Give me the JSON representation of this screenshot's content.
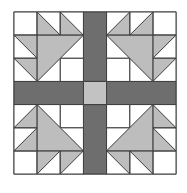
{
  "diagram": {
    "type": "quilt-block",
    "title": "",
    "grid_units": 7,
    "block": {
      "x": 14,
      "y": 12,
      "size": 162
    },
    "colors": {
      "background": "#ffffff",
      "white_fill": "#ffffff",
      "light_gray": "#bdbdbd",
      "dark_bar": "#6e6e6e",
      "center": "#c2c2c2",
      "line": "#3c3c3c"
    },
    "parts": [
      "four corner basket/flower units (3x3 each)",
      "dark gray sashing cross (1 unit wide)",
      "light gray center square"
    ]
  }
}
